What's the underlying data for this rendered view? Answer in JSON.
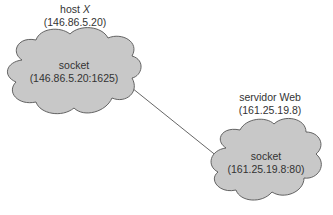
{
  "host": {
    "title_prefix": "host ",
    "title_italic": "X",
    "ip": "(146.86.5.20)",
    "socket_label": "socket",
    "socket_addr": "(146.86.5.20:1625)"
  },
  "server": {
    "title": "servidor Web",
    "ip": "(161.25.19.8)",
    "socket_label": "socket",
    "socket_addr": "(161.25.19.8:80)"
  },
  "colors": {
    "cloud_fill": "#c8c8c8",
    "cloud_stroke": "#555555",
    "line": "#555555",
    "text": "#333333"
  }
}
